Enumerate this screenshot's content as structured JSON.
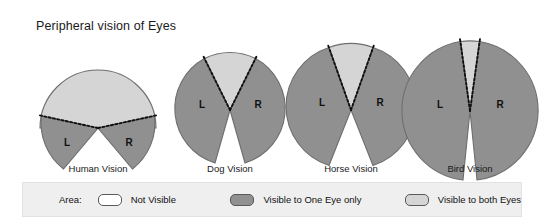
{
  "title": "Peripheral vision of Eyes",
  "colors": {
    "not_visible": "#ffffff",
    "visible_one_eye": "#909090",
    "visible_both_eyes": "#d5d5d5",
    "outline": "#5a5a5a",
    "legend_background": "#efefef",
    "text": "#111111"
  },
  "diagrams": [
    {
      "id": "human",
      "caption": "Human Vision",
      "left_eye_label": "L",
      "right_eye_label": "R",
      "binocular_field_degrees": 120,
      "total_field_degrees": 180,
      "monocular_wedge_degrees": 30
    },
    {
      "id": "dog",
      "caption": "Dog Vision",
      "left_eye_label": "L",
      "right_eye_label": "R",
      "binocular_field_degrees": 60,
      "total_field_degrees": 250,
      "monocular_wedge_degrees": 95
    },
    {
      "id": "horse",
      "caption": "Horse Vision",
      "left_eye_label": "L",
      "right_eye_label": "R",
      "binocular_field_degrees": 65,
      "total_field_degrees": 285,
      "monocular_wedge_degrees": 110
    },
    {
      "id": "bird",
      "caption": "Bird Vision",
      "left_eye_label": "L",
      "right_eye_label": "R",
      "binocular_field_degrees": 25,
      "total_field_degrees": 330,
      "monocular_wedge_degrees": 152
    }
  ],
  "legend": {
    "area_label": "Area:",
    "items": [
      {
        "swatch": "white",
        "label": "Not Visible"
      },
      {
        "swatch": "dark-gray",
        "label": "Visible to One Eye only"
      },
      {
        "swatch": "light-gray",
        "label": "Visible to both Eyes"
      }
    ]
  }
}
